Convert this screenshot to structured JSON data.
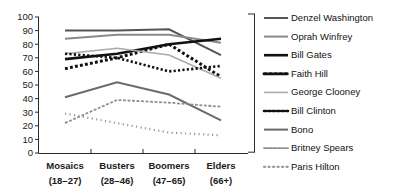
{
  "chart_data": {
    "type": "line",
    "title": "",
    "subtitle": "",
    "xlabel": "",
    "ylabel": "",
    "ylim": [
      0,
      100
    ],
    "ytick_step": 10,
    "yticks": [
      "0",
      "10",
      "20",
      "30",
      "40",
      "50",
      "60",
      "70",
      "80",
      "90",
      "100"
    ],
    "grid": false,
    "legend_position": "right",
    "categories": [
      "Mosaics",
      "Busters",
      "Boomers",
      "Elders"
    ],
    "category_sublabels": [
      "(18–27)",
      "(28–46)",
      "(47–65)",
      "(66+)"
    ],
    "series": [
      {
        "name": "Denzel Washington",
        "values": [
          90,
          90,
          91,
          72
        ],
        "color": "#555555",
        "width": 2.0,
        "dash": "none"
      },
      {
        "name": "Oprah Winfrey",
        "values": [
          84,
          87,
          87,
          81
        ],
        "color": "#8a8a8a",
        "width": 2.0,
        "dash": "none"
      },
      {
        "name": "Bill Gates",
        "values": [
          69,
          73,
          80,
          84
        ],
        "color": "#111111",
        "width": 2.6,
        "dash": "none"
      },
      {
        "name": "Faith Hill",
        "values": [
          62,
          70,
          80,
          56
        ],
        "color": "#111111",
        "width": 3.0,
        "dash": "dotted-large"
      },
      {
        "name": "George Clooney",
        "values": [
          73,
          77,
          72,
          55
        ],
        "color": "#aaaaaa",
        "width": 1.6,
        "dash": "none"
      },
      {
        "name": "Bill Clinton",
        "values": [
          73,
          70,
          60,
          64
        ],
        "color": "#111111",
        "width": 2.6,
        "dash": "dotted-medium"
      },
      {
        "name": "Bono",
        "values": [
          41,
          52,
          43,
          24
        ],
        "color": "#6b6b6b",
        "width": 2.0,
        "dash": "none"
      },
      {
        "name": "Britney Spears",
        "values": [
          22,
          39,
          37,
          34
        ],
        "color": "#8f8f8f",
        "width": 1.8,
        "dash": "dashed-fine"
      },
      {
        "name": "Paris Hilton",
        "values": [
          29,
          22,
          15,
          13
        ],
        "color": "#9a9a9a",
        "width": 2.2,
        "dash": "dotted-fine"
      }
    ]
  },
  "legend": {
    "items": [
      {
        "label": "Denzel Washington"
      },
      {
        "label": "Oprah Winfrey"
      },
      {
        "label": "Bill Gates"
      },
      {
        "label": "Faith Hill"
      },
      {
        "label": "George Clooney"
      },
      {
        "label": "Bill Clinton"
      },
      {
        "label": "Bono"
      },
      {
        "label": "Britney Spears"
      },
      {
        "label": "Paris Hilton"
      }
    ]
  }
}
